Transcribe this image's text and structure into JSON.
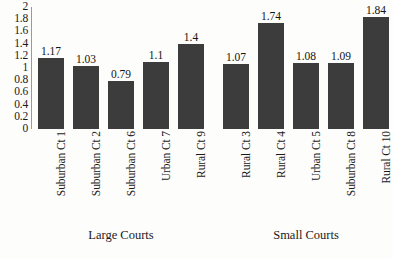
{
  "chart_data": {
    "type": "bar",
    "title": "",
    "xlabel": "",
    "ylabel": "",
    "ylim": [
      0,
      2
    ],
    "ytick_step": 0.2,
    "grid": false,
    "legend": "none",
    "bar_color": "#3c3c3c",
    "axis_color": "#9a9a9a",
    "yticks": [
      "2",
      "1.8",
      "1.6",
      "1.4",
      "1.2",
      "1",
      "0.8",
      "0.6",
      "0.4",
      "0.2",
      "0"
    ],
    "ytick_values": [
      2,
      1.8,
      1.6,
      1.4,
      1.2,
      1,
      0.8,
      0.6,
      0.4,
      0.2,
      0
    ],
    "categories": [
      "Suburban Ct 1",
      "Suburban Ct 2",
      "Suburban Ct 6",
      "Urban Ct 7",
      "Rural Ct 9",
      "Rural Ct 3",
      "Rural Ct 4",
      "Urban Ct 5",
      "Suburban Ct 8",
      "Rural Ct 10"
    ],
    "values": [
      1.17,
      1.03,
      0.79,
      1.1,
      1.4,
      1.07,
      1.74,
      1.08,
      1.09,
      1.84
    ],
    "data_labels": [
      "1.17",
      "1.03",
      "0.79",
      "1.1",
      "1.4",
      "1.07",
      "1.74",
      "1.08",
      "1.09",
      "1.84"
    ],
    "groups": [
      {
        "label": "Large Courts",
        "start": 0,
        "end": 4
      },
      {
        "label": "Small Courts",
        "start": 5,
        "end": 9
      }
    ],
    "group_labels": [
      "Large Courts",
      "Small Courts"
    ]
  }
}
